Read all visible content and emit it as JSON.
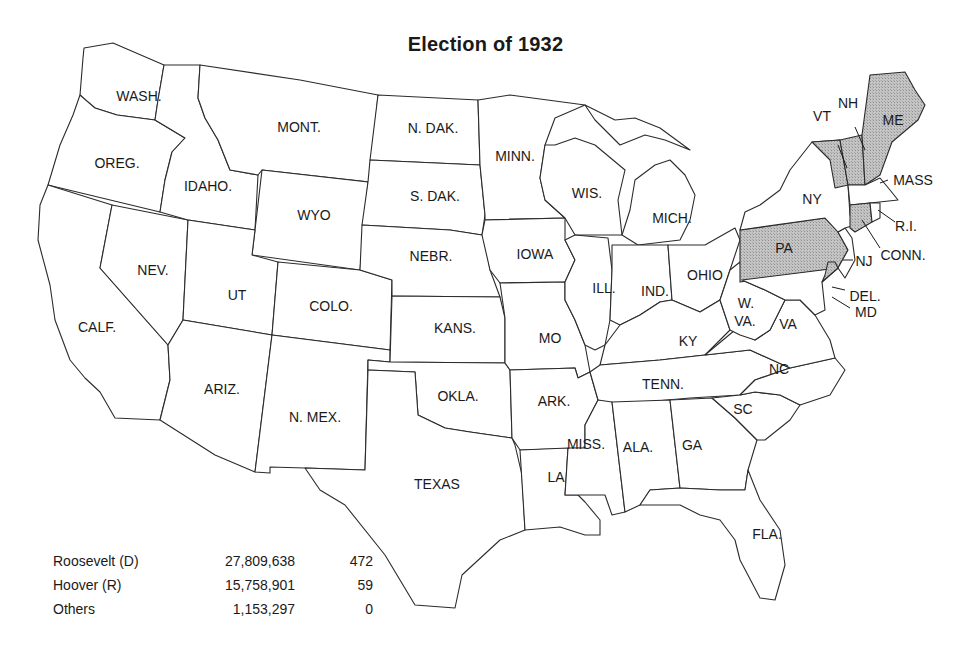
{
  "title": "Election of 1932",
  "colors": {
    "background": "#ffffff",
    "outline": "#2b2b2b",
    "hoover_fill": "#bdbdbd",
    "roosevelt_fill": "#ffffff"
  },
  "legend_note": "Shaded states carried by Hoover (R); unshaded states carried by Roosevelt (D)",
  "results": [
    {
      "candidate": "Roosevelt (D)",
      "popular_vote": "27,809,638",
      "electoral_vote": "472"
    },
    {
      "candidate": "Hoover (R)",
      "popular_vote": "15,758,901",
      "electoral_vote": "59"
    },
    {
      "candidate": "Others",
      "popular_vote": "1,153,297",
      "electoral_vote": "0"
    }
  ],
  "states": {
    "wash": "WASH.",
    "oreg": "OREG.",
    "calf": "CALF.",
    "idaho": "IDAHO.",
    "nev": "NEV.",
    "mont": "MONT.",
    "wyo": "WYO",
    "ut": "UT",
    "ariz": "ARIZ.",
    "colo": "COLO.",
    "nmex": "N. MEX.",
    "ndak": "N. DAK.",
    "sdak": "S. DAK.",
    "nebr": "NEBR.",
    "kans": "KANS.",
    "okla": "OKLA.",
    "texas": "TEXAS",
    "minn": "MINN.",
    "iowa": "IOWA",
    "mo": "MO",
    "ark": "ARK.",
    "la": "LA",
    "wis": "WIS.",
    "ill": "ILL.",
    "mich": "MICH.",
    "ind": "IND.",
    "ohio": "OHIO",
    "ky": "KY",
    "tenn": "TENN.",
    "miss": "MISS.",
    "ala": "ALA.",
    "ga": "GA",
    "fla": "FLA.",
    "sc": "SC",
    "nc": "NC",
    "va": "VA",
    "wva_1": "W.",
    "wva_2": "VA.",
    "md": "MD",
    "del": "DEL.",
    "pa": "PA",
    "nj": "NJ",
    "ny": "NY",
    "conn": "CONN.",
    "ri": "R.I.",
    "mass": "MASS",
    "vt": "VT",
    "nh": "NH",
    "me": "ME"
  },
  "hoover_states": [
    "PA",
    "DEL.",
    "CONN.",
    "VT",
    "NH",
    "ME"
  ]
}
